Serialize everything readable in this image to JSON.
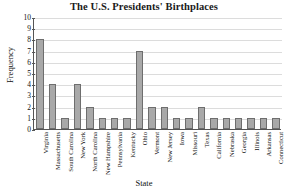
{
  "chart_data": {
    "type": "bar",
    "title": "The U.S. Presidents' Birthplaces",
    "xlabel": "State",
    "ylabel": "Frequency",
    "ylim": [
      0,
      10
    ],
    "yticks": [
      0,
      1,
      2,
      3,
      4,
      5,
      6,
      7,
      8,
      9,
      10
    ],
    "grid": true,
    "legend": null,
    "bar_color": "#a9a9a9",
    "bar_edge_color": "#6e6e6e",
    "categories": [
      "Virginia",
      "Massachusetts",
      "South Carolina",
      "New York",
      "North Carolina",
      "New Hampshire",
      "Pennsylvania",
      "Kentucky",
      "Ohio",
      "Vermont",
      "New Jersey",
      "Iowa",
      "Missouri",
      "Texas",
      "California",
      "Nebraska",
      "Georgia",
      "Illinois",
      "Arkansas",
      "Connecticut"
    ],
    "values": [
      8,
      4,
      1,
      4,
      2,
      1,
      1,
      1,
      7,
      2,
      2,
      1,
      1,
      2,
      1,
      1,
      1,
      1,
      1,
      1
    ]
  }
}
